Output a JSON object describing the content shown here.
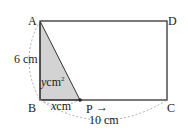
{
  "diagram": {
    "vertices": {
      "A": "A",
      "B": "B",
      "C": "C",
      "D": "D",
      "P": "P"
    },
    "labels": {
      "side_ab": "6 cm",
      "side_bc": "10 cm",
      "bp_var": "x",
      "bp_unit": "cm",
      "area_var": "y",
      "area_unit": "cm",
      "area_sup": "2",
      "arrow": "→"
    },
    "colors": {
      "stroke": "#333333",
      "shade": "#d3d3d3",
      "dashed": "#999999"
    }
  }
}
